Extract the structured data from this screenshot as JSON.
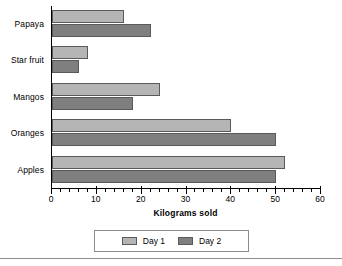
{
  "chart_data": {
    "type": "bar",
    "orientation": "horizontal",
    "title": "",
    "xlabel": "Kilograms sold",
    "ylabel": "",
    "xlim": [
      0,
      60
    ],
    "xticks": [
      0,
      10,
      20,
      30,
      40,
      50,
      60
    ],
    "xtick_labels": [
      "0",
      "10",
      "20",
      "30",
      "40",
      "50",
      "60"
    ],
    "minor_tick_step": 2,
    "grid": false,
    "legend_position": "bottom",
    "categories": [
      "Papaya",
      "Star fruit",
      "Mangos",
      "Oranges",
      "Apples"
    ],
    "series": [
      {
        "name": "Day 1",
        "color": "#b5b5b5",
        "values": [
          16,
          8,
          24,
          40,
          52
        ]
      },
      {
        "name": "Day 2",
        "color": "#7f7f7f",
        "values": [
          22,
          6,
          18,
          50,
          50
        ]
      }
    ]
  },
  "legend": {
    "items": [
      {
        "label": "Day 1",
        "color": "#b5b5b5"
      },
      {
        "label": "Day 2",
        "color": "#7f7f7f"
      }
    ]
  },
  "axis": {
    "x_title": "Kilograms sold"
  }
}
